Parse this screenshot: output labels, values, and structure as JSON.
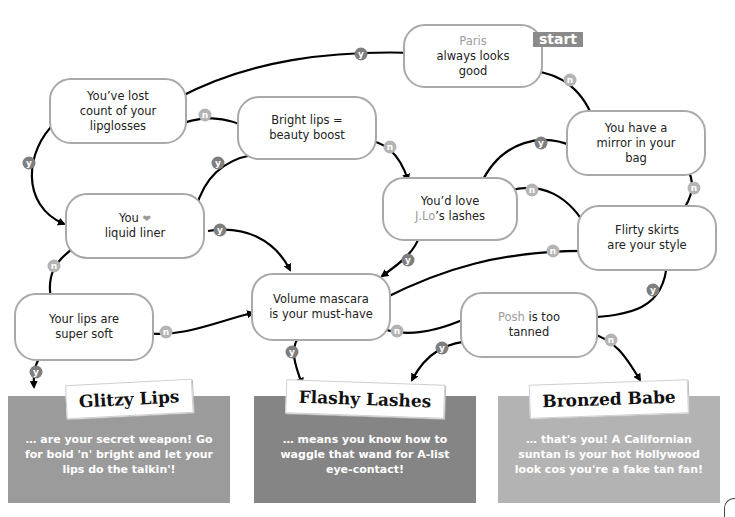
{
  "start_label": "start",
  "nodes": {
    "paris": {
      "highlight": "Paris",
      "line1": "always looks",
      "line2": "good"
    },
    "lipglosses": {
      "line1": "You’ve lost",
      "line2": "count of your",
      "line3": "lipglosses"
    },
    "bright_lips": {
      "line1": "Bright lips =",
      "line2": "beauty boost"
    },
    "mirror": {
      "line1": "You have a",
      "line2": "mirror in your",
      "line3": "bag"
    },
    "jlo": {
      "line1": "You’d love",
      "highlight": "J.Lo",
      "line2_rest": "’s lashes"
    },
    "liner": {
      "line1_pre": "You",
      "heart": "❤",
      "line2": "liquid liner"
    },
    "skirts": {
      "line1": "Flirty skirts",
      "line2": "are your style"
    },
    "soft_lips": {
      "line1": "Your lips are",
      "line2": "super soft"
    },
    "mascara": {
      "line1": "Volume mascara",
      "line2": "is your must-have"
    },
    "posh": {
      "highlight": "Posh",
      "line1_rest": " is too",
      "line2": "tanned"
    }
  },
  "badges": {
    "yes": "y",
    "no": "n"
  },
  "results": [
    {
      "title": "Glitzy Lips",
      "body": "… are your secret weapon! Go for bold 'n' bright and let your lips do the talkin'!",
      "color": "#9b9b9b"
    },
    {
      "title": "Flashy Lashes",
      "body": "… means you know how to waggle that wand for A-list eye-contact!",
      "color": "#858585"
    },
    {
      "title": "Bronzed Babe",
      "body": "… that's you! A Californian suntan is your hot Hollywood look cos you're a fake tan fan!",
      "color": "#b3b3b3"
    }
  ],
  "colors": {
    "node_border": "#a9a9a9",
    "yes_badge": "#7e7e7e",
    "no_badge": "#b4b4b4",
    "highlight_text": "#9c9c9c"
  }
}
